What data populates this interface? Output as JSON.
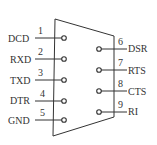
{
  "diagram": {
    "type": "DB9 serial connector pinout",
    "outline_color": "#333333",
    "left_pins": [
      {
        "number": "1",
        "label": "DCD",
        "y": 38
      },
      {
        "number": "2",
        "label": "RXD",
        "y": 59
      },
      {
        "number": "3",
        "label": "TXD",
        "y": 80
      },
      {
        "number": "4",
        "label": "DTR",
        "y": 101
      },
      {
        "number": "5",
        "label": "GND",
        "y": 120
      }
    ],
    "right_pins": [
      {
        "number": "6",
        "label": "DSR",
        "y": 49
      },
      {
        "number": "7",
        "label": "RTS",
        "y": 70
      },
      {
        "number": "8",
        "label": "CTS",
        "y": 91
      },
      {
        "number": "9",
        "label": "RI",
        "y": 112
      }
    ]
  }
}
